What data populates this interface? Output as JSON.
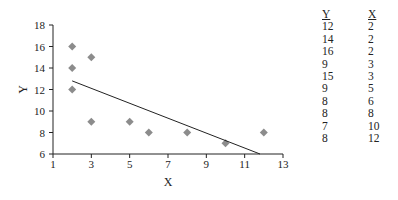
{
  "chart_data": {
    "type": "scatter",
    "title": "",
    "xlabel": "X",
    "ylabel": "Y",
    "xlim": [
      1,
      13
    ],
    "ylim": [
      6,
      18
    ],
    "x_ticks": [
      1,
      3,
      5,
      7,
      9,
      11,
      13
    ],
    "y_ticks": [
      6,
      8,
      10,
      12,
      14,
      16,
      18
    ],
    "grid": false,
    "legend": null,
    "series": [
      {
        "name": "observations",
        "marker": "diamond",
        "color": "#8c8c8c",
        "points": [
          {
            "x": 2,
            "y": 12
          },
          {
            "x": 2,
            "y": 14
          },
          {
            "x": 2,
            "y": 16
          },
          {
            "x": 3,
            "y": 9
          },
          {
            "x": 3,
            "y": 15
          },
          {
            "x": 5,
            "y": 9
          },
          {
            "x": 6,
            "y": 8
          },
          {
            "x": 8,
            "y": 8
          },
          {
            "x": 10,
            "y": 7
          },
          {
            "x": 12,
            "y": 8
          }
        ]
      }
    ],
    "trend_line": {
      "color": "#222222",
      "x1": 2,
      "y1": 12.8,
      "x2": 11.8,
      "y2": 6
    }
  },
  "table": {
    "headers": [
      "Y",
      "X"
    ],
    "rows": [
      [
        "12",
        "2"
      ],
      [
        "14",
        "2"
      ],
      [
        "16",
        "2"
      ],
      [
        "9",
        "3"
      ],
      [
        "15",
        "3"
      ],
      [
        "9",
        "5"
      ],
      [
        "8",
        "6"
      ],
      [
        "8",
        "8"
      ],
      [
        "7",
        "10"
      ],
      [
        "8",
        "12"
      ]
    ]
  }
}
